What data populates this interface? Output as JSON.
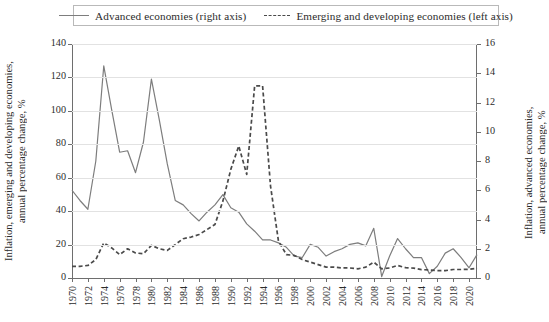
{
  "legend": {
    "items": [
      {
        "label": "Advanced economies (right axis)",
        "style": "solid",
        "color": "#7d7d7d"
      },
      {
        "label": "Emerging and developing economies (left axis)",
        "style": "dashed",
        "color": "#4a4a4a"
      }
    ]
  },
  "axes": {
    "left_title": "Inflation, emerging and developing economies,\nannual percentage change, %",
    "right_title": "Inflation, advanced economies,\nannual percentage change, %",
    "left_ticks": [
      "0",
      "20",
      "40",
      "60",
      "80",
      "100",
      "120",
      "140"
    ],
    "right_ticks": [
      "0",
      "2",
      "4",
      "6",
      "8",
      "10",
      "12",
      "14",
      "16"
    ],
    "x_ticks": [
      "1970",
      "1972",
      "1974",
      "1976",
      "1978",
      "1980",
      "1982",
      "1984",
      "1986",
      "1988",
      "1990",
      "1992",
      "1994",
      "1996",
      "1998",
      "2000",
      "2002",
      "2004",
      "2006",
      "2008",
      "2010",
      "2012",
      "2014",
      "2016",
      "2018",
      "2020"
    ]
  },
  "chart_data": {
    "type": "line",
    "title": "",
    "xlabel": "",
    "ylabel": "Inflation, emerging and developing economies, annual percentage change, %",
    "y2label": "Inflation, advanced economies, annual percentage change, %",
    "ylim": [
      0,
      140
    ],
    "y2lim": [
      0,
      16
    ],
    "xlim": [
      1970,
      2021
    ],
    "grid": true,
    "legend_position": "top",
    "x": [
      1970,
      1971,
      1972,
      1973,
      1974,
      1975,
      1976,
      1977,
      1978,
      1979,
      1980,
      1981,
      1982,
      1983,
      1984,
      1985,
      1986,
      1987,
      1988,
      1989,
      1990,
      1991,
      1992,
      1993,
      1994,
      1995,
      1996,
      1997,
      1998,
      1999,
      2000,
      2001,
      2002,
      2003,
      2004,
      2005,
      2006,
      2007,
      2008,
      2009,
      2010,
      2011,
      2012,
      2013,
      2014,
      2015,
      2016,
      2017,
      2018,
      2019,
      2020,
      2021
    ],
    "series": [
      {
        "name": "Advanced economies (right axis)",
        "axis": "right",
        "style": "solid",
        "color": "#7d7d7d",
        "units": "percent",
        "values": [
          6.0,
          5.3,
          4.7,
          8.0,
          14.5,
          11.5,
          8.6,
          8.7,
          7.2,
          9.3,
          13.6,
          10.8,
          7.8,
          5.3,
          5.0,
          4.4,
          3.9,
          4.5,
          5.0,
          5.7,
          4.8,
          4.5,
          3.7,
          3.2,
          2.6,
          2.6,
          2.4,
          2.1,
          1.5,
          1.4,
          2.3,
          2.1,
          1.5,
          1.8,
          2.0,
          2.3,
          2.4,
          2.2,
          3.4,
          0.1,
          1.5,
          2.7,
          2.0,
          1.4,
          1.4,
          0.3,
          0.8,
          1.7,
          2.0,
          1.4,
          0.7,
          1.6
        ]
      },
      {
        "name": "Emerging and developing economies (left axis)",
        "axis": "left",
        "style": "dashed",
        "color": "#4a4a4a",
        "units": "percent",
        "values": [
          7.0,
          7.0,
          7.5,
          11.0,
          21.0,
          18.0,
          14.0,
          17.5,
          15.0,
          14.5,
          19.5,
          17.5,
          16.5,
          20.0,
          23.5,
          24.5,
          26.0,
          29.0,
          32.0,
          46.0,
          65.0,
          79.0,
          62.0,
          115.0,
          115.0,
          55.0,
          22.0,
          14.0,
          13.5,
          11.0,
          9.5,
          8.0,
          6.5,
          6.5,
          6.0,
          6.0,
          5.5,
          6.5,
          9.5,
          5.5,
          6.0,
          7.5,
          6.2,
          5.9,
          5.0,
          4.8,
          4.4,
          4.4,
          5.1,
          5.1,
          5.2,
          5.9
        ]
      }
    ]
  }
}
